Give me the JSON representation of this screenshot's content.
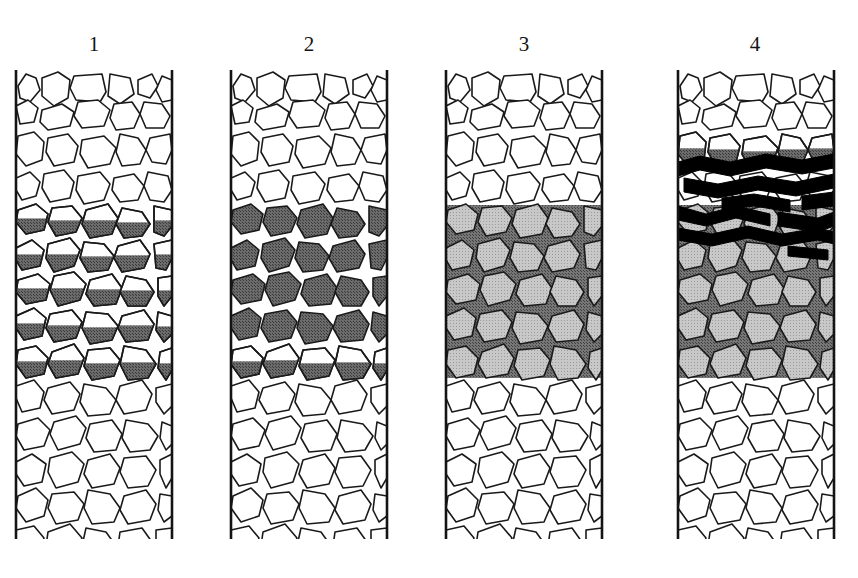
{
  "figure": {
    "background_color": "#ffffff",
    "width": 858,
    "height": 578
  },
  "colors": {
    "outline": "#1a1a1a",
    "column_border": "#141414",
    "clast_fill_empty": "#ffffff",
    "infill_dark": "#6b6b6b",
    "matrix_gray": "#767676",
    "clast_in_matrix": "#c8c8c8",
    "band_black": "#000000",
    "label_text": "#141414"
  },
  "columns": [
    {
      "id": "column-1",
      "label": "1",
      "label_x": 94,
      "label_y": 34,
      "x": 16,
      "y": 70,
      "width": 156,
      "height": 469,
      "stage": "partial geopetal infill",
      "zones": [
        {
          "name": "upper-open",
          "top": 70,
          "bottom": 195,
          "fill": "white"
        },
        {
          "name": "partial-infill",
          "top": 195,
          "bottom": 380,
          "fill": "clast-bottom-gray"
        },
        {
          "name": "lower-open",
          "top": 380,
          "bottom": 539,
          "fill": "white"
        }
      ]
    },
    {
      "id": "column-2",
      "label": "2",
      "label_x": 309,
      "label_y": 34,
      "x": 231,
      "y": 70,
      "width": 156,
      "height": 469,
      "stage": "clasts fully infilled, matrix open",
      "zones": [
        {
          "name": "upper-open",
          "top": 70,
          "bottom": 195,
          "fill": "white"
        },
        {
          "name": "transition-partial",
          "top": 195,
          "bottom": 215,
          "fill": "clast-bottom-gray"
        },
        {
          "name": "full-clast-infill",
          "top": 215,
          "bottom": 360,
          "fill": "clast-solid-gray"
        },
        {
          "name": "transition-partial-lower",
          "top": 360,
          "bottom": 382,
          "fill": "clast-bottom-gray"
        },
        {
          "name": "lower-open",
          "top": 382,
          "bottom": 539,
          "fill": "white"
        }
      ]
    },
    {
      "id": "column-3",
      "label": "3",
      "label_x": 524,
      "label_y": 34,
      "x": 446,
      "y": 70,
      "width": 156,
      "height": 469,
      "stage": "matrix-supported, full cementation",
      "zones": [
        {
          "name": "upper-open",
          "top": 70,
          "bottom": 205,
          "fill": "white"
        },
        {
          "name": "matrix-filled",
          "top": 205,
          "bottom": 378,
          "fill": "dark-matrix"
        },
        {
          "name": "lower-open",
          "top": 378,
          "bottom": 539,
          "fill": "white"
        }
      ]
    },
    {
      "id": "column-4",
      "label": "4",
      "label_x": 755,
      "label_y": 34,
      "x": 678,
      "y": 70,
      "width": 156,
      "height": 469,
      "stage": "matrix-supported with overlying black laminated bands",
      "zones": [
        {
          "name": "upper-open",
          "top": 70,
          "bottom": 120,
          "fill": "white"
        },
        {
          "name": "partial-infill",
          "top": 120,
          "bottom": 155,
          "fill": "clast-bottom-gray"
        },
        {
          "name": "black-bands",
          "top": 155,
          "bottom": 205,
          "fill": "black-laminae"
        },
        {
          "name": "matrix-filled",
          "top": 205,
          "bottom": 378,
          "fill": "dark-matrix"
        },
        {
          "name": "lower-open",
          "top": 378,
          "bottom": 539,
          "fill": "white"
        }
      ]
    }
  ],
  "clast_geometry": {
    "note": "Shared outline polygons repeated identically in every column, expressed in column-local coordinates (0..156 wide, 0..469 tall).",
    "rows": [
      {
        "y": 2,
        "shapes": [
          "2,14 10,2 20,6 24,18 14,30 4,26",
          "26,6 42,0 54,8 52,26 38,34 26,24",
          "58,4 86,2 90,20 84,30 60,28 54,16",
          "94,2 114,6 118,22 104,32 92,24",
          "122,8 136,2 142,14 134,26 122,22",
          "146,4 156,8 156,28 146,30 140,18"
        ]
      },
      {
        "y": 30,
        "shapes": [
          "0,6 12,0 22,8 18,22 4,24",
          "26,10 46,4 58,12 54,26 32,30 24,22",
          "62,2 82,0 94,10 88,26 66,28 58,16",
          "98,4 116,2 124,14 118,28 100,30 94,18",
          "128,2 146,4 154,16 148,28 130,28 124,14"
        ]
      },
      {
        "y": 62,
        "shapes": [
          "2,4 18,0 28,10 26,28 10,34 0,22",
          "32,6 52,2 62,14 58,30 38,34 30,20",
          "66,8 88,4 100,16 94,32 72,36 64,22",
          "104,2 122,6 130,18 124,32 106,34 100,20",
          "134,6 154,2 156,18 150,32 136,30 130,18"
        ]
      },
      {
        "y": 100,
        "shapes": [
          "0,8 14,2 24,12 20,26 6,30 0,20",
          "28,4 48,0 58,12 54,28 34,32 26,18",
          "62,6 84,2 94,14 88,30 68,34 60,20",
          "98,8 118,4 128,16 122,30 104,32 96,20",
          "132,2 152,6 156,20 148,32 134,30 128,16"
        ]
      },
      {
        "y": 134,
        "shapes": [
          "2,6 20,0 32,10 28,26 10,30 0,18",
          "36,4 56,2 66,14 60,28 40,32 32,18",
          "70,6 92,0 102,14 96,30 74,34 66,20",
          "106,4 126,8 134,20 126,32 108,34 100,20",
          "138,2 156,6 156,22 148,32 138,28"
        ]
      },
      {
        "y": 168,
        "shapes": [
          "0,10 16,2 28,12 24,28 6,32 0,22",
          "32,6 54,0 64,12 58,28 38,34 30,20",
          "68,4 88,6 98,18 92,32 72,34 64,20",
          "102,8 124,2 134,16 128,30 106,34 98,20",
          "138,6 156,2 156,20 150,32 140,30"
        ]
      },
      {
        "y": 202,
        "shapes": [
          "2,8 22,2 34,12 30,28 10,32 0,20",
          "38,4 58,0 70,12 64,28 42,34 34,18",
          "74,8 96,2 106,16 100,32 78,34 70,22",
          "110,4 130,8 138,20 130,34 112,34 104,20",
          "142,6 156,4 156,24 148,34 142,24"
        ]
      },
      {
        "y": 238,
        "shapes": [
          "0,8 18,0 30,10 26,28 8,32 0,20",
          "34,6 56,2 66,14 60,30 38,34 30,20",
          "70,4 92,6 102,18 96,32 74,36 66,20",
          "106,8 128,2 138,16 132,32 110,34 102,20",
          "142,4 156,8 156,26 148,34 140,22"
        ]
      },
      {
        "y": 274,
        "shapes": [
          "2,6 20,2 32,14 28,30 10,34 0,20",
          "36,8 58,0 68,14 62,30 40,34 32,20",
          "72,6 94,4 104,16 98,32 76,36 68,22",
          "108,2 130,6 140,20 132,34 112,36 104,20",
          "144,8 156,4 156,26 150,36 142,24"
        ]
      },
      {
        "y": 310,
        "shapes": [
          "0,6 18,0 28,12 24,28 6,32 0,18",
          "32,8 54,2 64,14 58,30 36,34 28,20",
          "68,4 90,8 100,20 94,34 72,36 64,22",
          "104,6 126,0 136,14 130,30 108,34 100,20",
          "140,8 156,4 156,26 148,34 140,22"
        ]
      },
      {
        "y": 346,
        "shapes": [
          "2,8 22,2 34,14 28,30 8,34 0,20",
          "38,6 60,0 70,12 64,28 42,34 34,18",
          "74,8 96,4 106,18 100,34 78,36 70,22",
          "110,4 132,8 142,20 134,34 114,36 106,22",
          "146,6 156,10 156,28 150,34 144,22"
        ]
      },
      {
        "y": 382,
        "shapes": [
          "0,10 16,2 30,12 26,30 8,34 0,22",
          "34,6 56,0 68,12 62,30 40,36 32,20",
          "72,8 94,2 104,16 98,32 76,36 68,22",
          "108,6 130,4 140,18 132,34 112,36 104,20",
          "144,8 156,2 156,26 150,36 144,22"
        ]
      },
      {
        "y": 418,
        "shapes": [
          "2,8 20,0 32,12 28,28 10,34 0,20",
          "36,6 58,4 68,16 62,32 40,36 32,20",
          "72,2 94,6 104,20 98,34 76,36 68,20",
          "108,8 130,2 140,16 134,32 112,36 104,22",
          "144,6 156,8 156,28 148,34 142,22"
        ]
      },
      {
        "y": 454,
        "shapes": [
          "0,6 18,2 28,14 22,32 6,36 0,20",
          "32,8 54,0 66,14 58,32 38,38 30,22",
          "70,4 90,8 100,22 94,36 74,38 66,22",
          "104,8 126,4 136,18 130,34 110,38 102,22",
          "140,6 156,4 156,28 148,36 140,24"
        ]
      }
    ]
  },
  "black_bands": {
    "note": "Thick wavy black laminae in column 4 only, column-local coords.",
    "paths": [
      "M 0,92 L 22,86 L 52,92 L 88,84 L 124,90 L 156,84 L 156,98 L 124,104 L 88,98 L 52,106 L 22,100 L 0,106 Z",
      "M 6,108 L 40,114 L 80,106 L 118,112 L 156,104 L 156,118 L 118,126 L 80,120 L 40,128 L 6,122 Z",
      "M 44,128 L 76,124 L 112,130 L 112,142 L 76,136 L 44,140 Z",
      "M 124,126 L 156,122 L 156,136 L 124,140 Z",
      "M 0,136 L 28,144 L 58,136 L 92,144 L 92,156 L 58,148 L 28,156 L 0,150 Z",
      "M 100,142 L 140,148 L 156,142 L 156,156 L 140,162 L 100,156 Z",
      "M 0,158 L 34,164 L 70,156 L 104,164 L 140,158 L 156,162 L 156,174 L 140,170 L 104,176 L 70,168 L 34,176 L 0,170 Z",
      "M 110,176 L 150,180 L 150,190 L 110,186 Z"
    ]
  }
}
